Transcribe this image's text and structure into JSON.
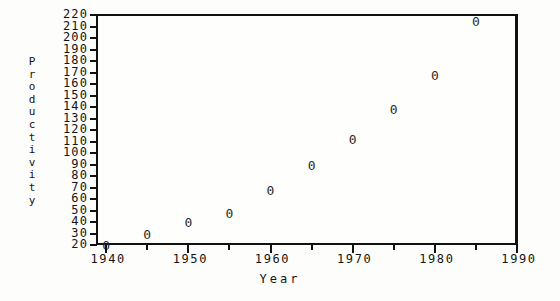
{
  "chart_data": {
    "type": "scatter",
    "title": "",
    "xlabel": "Year",
    "ylabel": "Productivity",
    "x": [
      1940,
      1945,
      1950,
      1955,
      1960,
      1965,
      1970,
      1975,
      1980,
      1985
    ],
    "values": [
      20,
      30,
      40,
      48,
      68,
      90,
      112,
      138,
      168,
      215
    ],
    "series": [
      {
        "name": "Productivity",
        "marker": "0",
        "points": [
          {
            "x": 1940,
            "y": 20
          },
          {
            "x": 1945,
            "y": 30
          },
          {
            "x": 1950,
            "y": 40
          },
          {
            "x": 1955,
            "y": 48
          },
          {
            "x": 1960,
            "y": 68
          },
          {
            "x": 1965,
            "y": 90
          },
          {
            "x": 1970,
            "y": 112
          },
          {
            "x": 1975,
            "y": 138
          },
          {
            "x": 1980,
            "y": 168
          },
          {
            "x": 1985,
            "y": 215
          }
        ]
      }
    ],
    "xlim": [
      1939,
      1990
    ],
    "ylim": [
      20,
      220
    ],
    "xticks": [
      1940,
      1950,
      1960,
      1970,
      1980,
      1990
    ],
    "xticklabels": [
      "1940",
      "1950",
      "1960",
      "1970",
      "1980",
      "1990"
    ],
    "xminorticks": [
      1945,
      1955,
      1965,
      1975,
      1985
    ],
    "yticks": [
      20,
      30,
      40,
      50,
      60,
      70,
      80,
      90,
      100,
      110,
      120,
      130,
      140,
      150,
      160,
      170,
      180,
      190,
      200,
      210,
      220
    ],
    "yticklabels": [
      "20",
      "30",
      "40",
      "50",
      "60",
      "70",
      "80",
      "90",
      "100",
      "110",
      "120",
      "130",
      "140",
      "150",
      "160",
      "170",
      "180",
      "190",
      "200",
      "210",
      "220"
    ],
    "grid": false,
    "legend": false,
    "legend_position": "none",
    "colors": {
      "background": "#fdfdfb",
      "axis": "#111111",
      "marker": "#2b2b2b",
      "text": "#141414"
    }
  },
  "axes": {
    "y_title_text": "Productivity",
    "x_title_text": "Year"
  }
}
